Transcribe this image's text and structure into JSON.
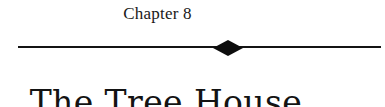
{
  "page": {
    "background_color": "#ffffff",
    "text_color": "#131313"
  },
  "chapter_header": {
    "number_label": "Chapter 8",
    "title": "The Tree House",
    "divider": {
      "ornament": "diamond",
      "rule_color": "#141414",
      "ornament_color": "#0d0d0d"
    }
  }
}
